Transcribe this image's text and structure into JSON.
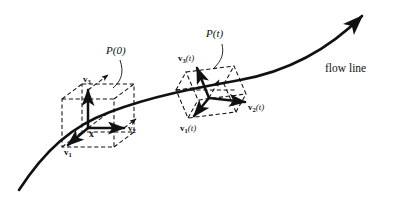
{
  "figure": {
    "background_color": "#ffffff",
    "stroke_color": "#111111",
    "width": 398,
    "height": 210
  },
  "flow_line": {
    "label": "flow line",
    "arrow_end": "top-right",
    "style": "solid"
  },
  "parallelepiped_initial": {
    "label": "P(0)",
    "origin_label": "x",
    "vectors": [
      {
        "name": "v1",
        "text": "v",
        "subscript": "1",
        "argument": ""
      },
      {
        "name": "v2",
        "text": "v",
        "subscript": "2",
        "argument": ""
      },
      {
        "name": "v3",
        "text": "v",
        "subscript": "3",
        "argument": ""
      }
    ],
    "edge_style": "dashed"
  },
  "parallelepiped_transported": {
    "label": "P(t)",
    "vectors": [
      {
        "name": "v1t",
        "text": "v",
        "subscript": "1",
        "argument": "(t)"
      },
      {
        "name": "v2t",
        "text": "v",
        "subscript": "2",
        "argument": "(t)"
      },
      {
        "name": "v3t",
        "text": "v",
        "subscript": "3",
        "argument": "(t)"
      }
    ],
    "edge_style": "dashed"
  }
}
